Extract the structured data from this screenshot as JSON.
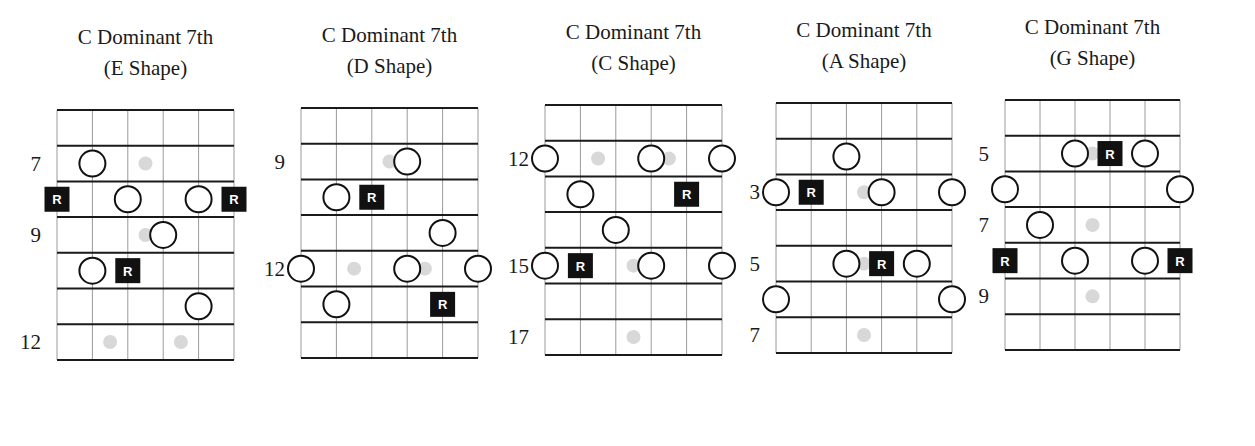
{
  "colors": {
    "background": "#ffffff",
    "line": "#1a1a1a",
    "string_line": "#9a9a9a",
    "root_fill": "#111111",
    "root_text": "#ffffff",
    "ghost_dot": "#d8d8d8",
    "circle_stroke": "#111111"
  },
  "legend": {
    "root_symbol": "R"
  },
  "diagrams": [
    {
      "title_line1": "C Dominant 7th",
      "title_line2": "(E Shape)",
      "origin": {
        "x": 57,
        "y": 110
      },
      "string_spacing": 35.4,
      "fret_spacing": 35.7,
      "fret_labels": [
        {
          "row": 1,
          "text": "7"
        },
        {
          "row": 3,
          "text": "9"
        },
        {
          "row": 6,
          "text": "12"
        }
      ],
      "notes": [
        {
          "type": "ghost",
          "s": 2.5,
          "row": 1
        },
        {
          "type": "circle",
          "s": 1,
          "row": 1
        },
        {
          "type": "root",
          "s": 0,
          "row": 2
        },
        {
          "type": "circle",
          "s": 2,
          "row": 2
        },
        {
          "type": "circle",
          "s": 4,
          "row": 2
        },
        {
          "type": "root",
          "s": 5,
          "row": 2
        },
        {
          "type": "ghost",
          "s": 2.5,
          "row": 3
        },
        {
          "type": "circle",
          "s": 3,
          "row": 3
        },
        {
          "type": "circle",
          "s": 1,
          "row": 4
        },
        {
          "type": "root",
          "s": 2,
          "row": 4
        },
        {
          "type": "circle",
          "s": 4,
          "row": 5
        },
        {
          "type": "ghost",
          "s": 1.5,
          "row": 6
        },
        {
          "type": "ghost",
          "s": 3.5,
          "row": 6
        }
      ]
    },
    {
      "title_line1": "C Dominant 7th",
      "title_line2": "(D Shape)",
      "origin": {
        "x": 301,
        "y": 108
      },
      "string_spacing": 35.4,
      "fret_spacing": 35.7,
      "fret_labels": [
        {
          "row": 1,
          "text": "9"
        },
        {
          "row": 4,
          "text": "12"
        }
      ],
      "notes": [
        {
          "type": "ghost",
          "s": 2.5,
          "row": 1
        },
        {
          "type": "circle",
          "s": 3,
          "row": 1
        },
        {
          "type": "circle",
          "s": 1,
          "row": 2
        },
        {
          "type": "root",
          "s": 2,
          "row": 2
        },
        {
          "type": "circle",
          "s": 4,
          "row": 3
        },
        {
          "type": "ghost",
          "s": 1.5,
          "row": 4
        },
        {
          "type": "ghost",
          "s": 3.5,
          "row": 4
        },
        {
          "type": "circle",
          "s": 0,
          "row": 4
        },
        {
          "type": "circle",
          "s": 3,
          "row": 4
        },
        {
          "type": "circle",
          "s": 5,
          "row": 4
        },
        {
          "type": "circle",
          "s": 1,
          "row": 5
        },
        {
          "type": "root",
          "s": 4,
          "row": 5
        }
      ]
    },
    {
      "title_line1": "C Dominant 7th",
      "title_line2": "(C Shape)",
      "origin": {
        "x": 545,
        "y": 105
      },
      "string_spacing": 35.4,
      "fret_spacing": 35.7,
      "fret_labels": [
        {
          "row": 1,
          "text": "12"
        },
        {
          "row": 4,
          "text": "15"
        },
        {
          "row": 6,
          "text": "17"
        }
      ],
      "notes": [
        {
          "type": "ghost",
          "s": 1.5,
          "row": 1
        },
        {
          "type": "ghost",
          "s": 3.5,
          "row": 1
        },
        {
          "type": "circle",
          "s": 0,
          "row": 1
        },
        {
          "type": "circle",
          "s": 3,
          "row": 1
        },
        {
          "type": "circle",
          "s": 5,
          "row": 1
        },
        {
          "type": "circle",
          "s": 1,
          "row": 2
        },
        {
          "type": "root",
          "s": 4,
          "row": 2
        },
        {
          "type": "circle",
          "s": 2,
          "row": 3
        },
        {
          "type": "ghost",
          "s": 2.5,
          "row": 4
        },
        {
          "type": "circle",
          "s": 0,
          "row": 4
        },
        {
          "type": "root",
          "s": 1,
          "row": 4
        },
        {
          "type": "circle",
          "s": 3,
          "row": 4
        },
        {
          "type": "circle",
          "s": 5,
          "row": 4
        },
        {
          "type": "ghost",
          "s": 2.5,
          "row": 6
        }
      ]
    },
    {
      "title_line1": "C Dominant 7th",
      "title_line2": "(A Shape)",
      "origin": {
        "x": 776,
        "y": 103
      },
      "string_spacing": 35.2,
      "fret_spacing": 35.7,
      "fret_labels": [
        {
          "row": 2,
          "text": "3"
        },
        {
          "row": 4,
          "text": "5"
        },
        {
          "row": 6,
          "text": "7"
        }
      ],
      "notes": [
        {
          "type": "circle",
          "s": 2,
          "row": 1
        },
        {
          "type": "ghost",
          "s": 2.5,
          "row": 2
        },
        {
          "type": "circle",
          "s": 0,
          "row": 2
        },
        {
          "type": "root",
          "s": 1,
          "row": 2
        },
        {
          "type": "circle",
          "s": 3,
          "row": 2
        },
        {
          "type": "circle",
          "s": 5,
          "row": 2
        },
        {
          "type": "ghost",
          "s": 2.5,
          "row": 4
        },
        {
          "type": "circle",
          "s": 2,
          "row": 4
        },
        {
          "type": "root",
          "s": 3,
          "row": 4
        },
        {
          "type": "circle",
          "s": 4,
          "row": 4
        },
        {
          "type": "circle",
          "s": 0,
          "row": 5
        },
        {
          "type": "circle",
          "s": 5,
          "row": 5
        },
        {
          "type": "ghost",
          "s": 2.5,
          "row": 6
        }
      ]
    },
    {
      "title_line1": "C Dominant 7th",
      "title_line2": "(G Shape)",
      "origin": {
        "x": 1005,
        "y": 100
      },
      "string_spacing": 35.0,
      "fret_spacing": 35.7,
      "fret_labels": [
        {
          "row": 1,
          "text": "5"
        },
        {
          "row": 3,
          "text": "7"
        },
        {
          "row": 5,
          "text": "9"
        }
      ],
      "notes": [
        {
          "type": "ghost",
          "s": 2.5,
          "row": 1
        },
        {
          "type": "circle",
          "s": 2,
          "row": 1
        },
        {
          "type": "root",
          "s": 3,
          "row": 1
        },
        {
          "type": "circle",
          "s": 4,
          "row": 1
        },
        {
          "type": "circle",
          "s": 0,
          "row": 2
        },
        {
          "type": "circle",
          "s": 5,
          "row": 2
        },
        {
          "type": "circle",
          "s": 1,
          "row": 3
        },
        {
          "type": "ghost",
          "s": 2.5,
          "row": 3
        },
        {
          "type": "root",
          "s": 0,
          "row": 4
        },
        {
          "type": "circle",
          "s": 2,
          "row": 4
        },
        {
          "type": "circle",
          "s": 4,
          "row": 4
        },
        {
          "type": "root",
          "s": 5,
          "row": 4
        },
        {
          "type": "ghost",
          "s": 2.5,
          "row": 5
        }
      ]
    }
  ]
}
